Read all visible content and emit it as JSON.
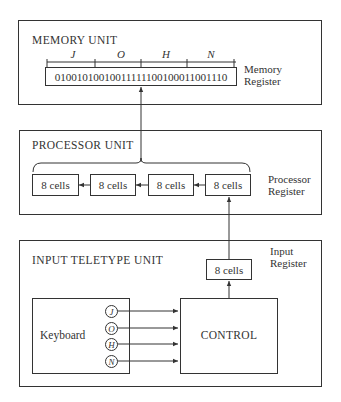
{
  "diagram": {
    "memory_unit": {
      "title": "MEMORY UNIT",
      "register_label_line1": "Memory",
      "register_label_line2": "Register",
      "register_bits": "01001010010011111100100011001110",
      "segment_letters": [
        "J",
        "O",
        "H",
        "N"
      ]
    },
    "processor_unit": {
      "title": "PROCESSOR UNIT",
      "register_label_line1": "Processor",
      "register_label_line2": "Register",
      "cells": [
        "8 cells",
        "8 cells",
        "8 cells",
        "8 cells"
      ]
    },
    "input_unit": {
      "title": "INPUT TELETYPE UNIT",
      "register_label_line1": "Input",
      "register_label_line2": "Register",
      "register_cell": "8 cells",
      "keyboard_label": "Keyboard",
      "keys": [
        "J",
        "O",
        "H",
        "N"
      ],
      "control_label": "CONTROL"
    },
    "flow": [
      {
        "from": "keyboard-keys",
        "to": "control",
        "count": 4
      },
      {
        "from": "control",
        "to": "input-register"
      },
      {
        "from": "input-register",
        "to": "processor-register-cell-4"
      },
      {
        "from": "processor-register-cell-4",
        "to": "processor-register-cell-1",
        "direction": "right-to-left shift"
      },
      {
        "from": "processor-register",
        "to": "memory-register"
      }
    ]
  }
}
